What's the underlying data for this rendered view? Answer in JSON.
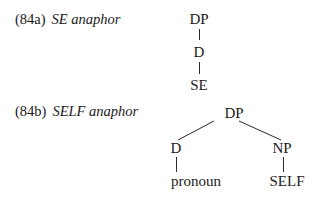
{
  "examples": [
    {
      "number": "(84a)",
      "title": "SE anaphor",
      "tree": {
        "root": "DP",
        "child": "D",
        "leaf": "SE"
      }
    },
    {
      "number": "(84b)",
      "title": "SELF anaphor",
      "tree": {
        "root": "DP",
        "left": {
          "label": "D",
          "leaf": "pronoun"
        },
        "right": {
          "label": "NP",
          "leaf": "SELF"
        }
      }
    }
  ]
}
